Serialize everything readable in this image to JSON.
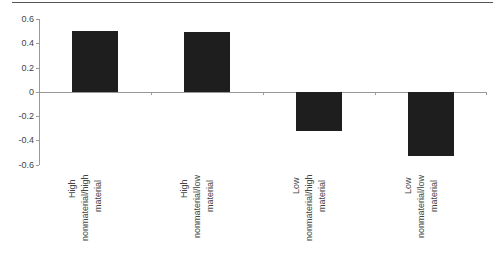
{
  "chart_data": {
    "type": "bar",
    "title": "",
    "xlabel": "",
    "ylabel": "",
    "categories": [
      "High nonmaterial/high material",
      "High nonmaterial/low material",
      "Low nonmaterial/high material",
      "Low nonmaterial/low material"
    ],
    "category_label_lines": [
      [
        "High",
        "nonmaterial/high",
        "material"
      ],
      [
        "High",
        "nonmaterial/low",
        "material"
      ],
      [
        "Low",
        "nonmaterial/high",
        "material"
      ],
      [
        "Low",
        "nonmaterial/low",
        "material"
      ]
    ],
    "values": [
      0.5,
      0.49,
      -0.32,
      -0.53
    ],
    "ylim": [
      -0.6,
      0.6
    ],
    "yticks": [
      "0.6",
      "0.4",
      "0.2",
      "0",
      "-0.2",
      "-0.4",
      "-0.6"
    ],
    "grid": false,
    "legend": null,
    "bar_color": "#1e1e1e"
  }
}
